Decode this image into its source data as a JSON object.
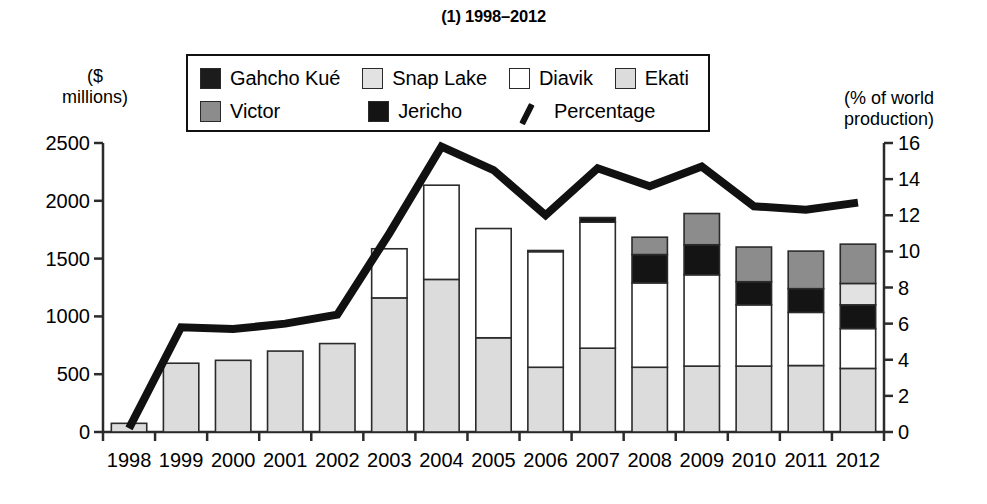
{
  "title": "(1) 1998–2012",
  "legend": {
    "rows": [
      [
        {
          "label": "Gahcho Kué",
          "swatch": "legend-swatch",
          "color": "#1c1c1c",
          "type": "box"
        },
        {
          "label": "Snap Lake",
          "swatch": "legend-swatch",
          "color": "#e2e2e2",
          "type": "box"
        },
        {
          "label": "Diavik",
          "swatch": "legend-swatch",
          "color": "#ffffff",
          "type": "box"
        },
        {
          "label": "Ekati",
          "swatch": "legend-swatch",
          "color": "#dcdcdc",
          "type": "box"
        }
      ],
      [
        {
          "label": "Victor",
          "swatch": "legend-swatch",
          "color": "#8c8c8c",
          "type": "box"
        },
        {
          "label": "Jericho",
          "swatch": "legend-swatch",
          "color": "#141414",
          "type": "box"
        },
        {
          "label": "Percentage",
          "swatch": "legend-line-icon",
          "color": "#111111",
          "type": "line"
        }
      ]
    ]
  },
  "axes": {
    "left_caption": "($\nmillions)",
    "right_caption": "(% of world\nproduction)",
    "left_ticks": [
      "2500",
      "2000",
      "1500",
      "1000",
      "500",
      "0"
    ],
    "right_ticks": [
      "16",
      "14",
      "12",
      "10",
      "8",
      "6",
      "4",
      "2",
      "0"
    ]
  },
  "chart_data": {
    "type": "bar",
    "title": "(1) 1998–2012",
    "xlabel": "",
    "ylabel": "($ millions)",
    "y2label": "(% of world production)",
    "ylim": [
      0,
      2500
    ],
    "y2lim": [
      0,
      16
    ],
    "grid": false,
    "legend_position": "top-center",
    "stacked": true,
    "categories": [
      "1998",
      "1999",
      "2000",
      "2001",
      "2002",
      "2003",
      "2004",
      "2005",
      "2006",
      "2007",
      "2008",
      "2009",
      "2010",
      "2011",
      "2012"
    ],
    "series": [
      {
        "name": "Ekati",
        "color": "#dcdcdc",
        "values": [
          75,
          595,
          620,
          700,
          765,
          1160,
          1320,
          815,
          560,
          725,
          560,
          570,
          570,
          575,
          550
        ]
      },
      {
        "name": "Diavik",
        "color": "#ffffff",
        "values": [
          0,
          0,
          0,
          0,
          0,
          425,
          815,
          945,
          1000,
          1090,
          730,
          790,
          530,
          460,
          345
        ]
      },
      {
        "name": "Jericho",
        "color": "#141414",
        "values": [
          0,
          0,
          0,
          0,
          0,
          0,
          0,
          0,
          10,
          40,
          245,
          260,
          200,
          205,
          205
        ]
      },
      {
        "name": "Snap Lake",
        "color": "#e2e2e2",
        "values": [
          0,
          0,
          0,
          0,
          0,
          0,
          0,
          0,
          0,
          0,
          0,
          0,
          0,
          0,
          185
        ]
      },
      {
        "name": "Victor",
        "color": "#8c8c8c",
        "values": [
          0,
          0,
          0,
          0,
          0,
          0,
          0,
          0,
          0,
          0,
          150,
          270,
          300,
          325,
          340
        ]
      },
      {
        "name": "Gahcho Kué",
        "color": "#1c1c1c",
        "values": [
          0,
          0,
          0,
          0,
          0,
          0,
          0,
          0,
          0,
          0,
          0,
          0,
          0,
          0,
          0
        ]
      }
    ],
    "totals": [
      75,
      595,
      620,
      700,
      765,
      1585,
      2135,
      1760,
      1570,
      1855,
      1685,
      1890,
      1600,
      1565,
      1625
    ],
    "line_series": {
      "name": "Percentage",
      "color": "#111111",
      "unit": "% of world production",
      "values": [
        0.2,
        5.8,
        5.7,
        6.0,
        6.5,
        11.0,
        15.8,
        14.5,
        12.0,
        14.6,
        13.6,
        14.7,
        12.5,
        12.3,
        12.7
      ]
    }
  }
}
